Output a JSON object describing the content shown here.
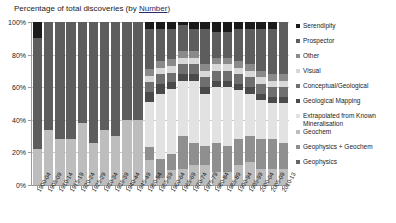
{
  "chart": {
    "title_main": "Percentage of total discoveries (by ",
    "title_underlined": "Number",
    "title_close": ")"
  },
  "axis": {
    "y_ticks": [
      "100%",
      "80%",
      "60%",
      "40%",
      "20%",
      "0%"
    ],
    "y_values": [
      100,
      80,
      60,
      40,
      20,
      0
    ]
  },
  "legend": {
    "items": [
      {
        "label": "Serendipity",
        "color": "#1a1a1a"
      },
      {
        "label": "Prospector",
        "color": "#5d5d5d"
      },
      {
        "label": "Other",
        "color": "#8a8a8a"
      },
      {
        "label": "Visual",
        "color": "#d8d8d8"
      },
      {
        "label": "Conceptual/Geological",
        "color": "#6f6f6f"
      },
      {
        "label": "Geological Mapping",
        "color": "#4a4a4a"
      },
      {
        "label": "Extrapolated from Known Mineralisation",
        "color": "#e2e2e2"
      },
      {
        "label": "Geochem",
        "color": "#bdbdbd"
      },
      {
        "label": "Geophysics + Geochem",
        "color": "#8f8f8f"
      },
      {
        "label": "Geophysics",
        "color": "#666666"
      }
    ]
  },
  "chart_data": {
    "type": "bar",
    "subtype": "100% stacked column",
    "title": "Percentage of total discoveries (by Number)",
    "xlabel": "",
    "ylabel": "",
    "ylim": [
      0,
      100
    ],
    "grid": true,
    "legend_position": "right",
    "categories": [
      "1900-04",
      "1905-09",
      "1910-14",
      "1915-19",
      "1920-24",
      "1925-29",
      "1930-34",
      "1935-39",
      "1940-44",
      "1945-49",
      "1950-54",
      "1955-59",
      "1960-64",
      "1965-69",
      "1970-74",
      "1975-79",
      "1980-84",
      "1985-89",
      "1990-94",
      "1995-99",
      "2000-04",
      "2005-09",
      "2010-13"
    ],
    "series": [
      {
        "name": "Geochem",
        "values": [
          22,
          34,
          28,
          28,
          38,
          26,
          34,
          30,
          40,
          40,
          15,
          4,
          9,
          10,
          12,
          12,
          8,
          8,
          12,
          14,
          10,
          10,
          10
        ]
      },
      {
        "name": "Geophysics + Geochem",
        "values": [
          0,
          0,
          0,
          0,
          0,
          0,
          0,
          0,
          0,
          0,
          8,
          12,
          10,
          20,
          14,
          12,
          18,
          16,
          16,
          16,
          18,
          18,
          16
        ]
      },
      {
        "name": "Extrapolated from Known Mineralisation",
        "values": [
          0,
          0,
          0,
          0,
          0,
          0,
          0,
          0,
          0,
          0,
          28,
          40,
          40,
          34,
          38,
          32,
          34,
          36,
          30,
          26,
          24,
          22,
          24
        ]
      },
      {
        "name": "Geological Mapping",
        "values": [
          0,
          0,
          0,
          0,
          0,
          0,
          0,
          0,
          0,
          0,
          6,
          6,
          4,
          4,
          4,
          4,
          4,
          4,
          4,
          4,
          4,
          4,
          4
        ]
      },
      {
        "name": "Conceptual/Geological",
        "values": [
          0,
          0,
          0,
          0,
          0,
          0,
          0,
          0,
          0,
          0,
          6,
          6,
          6,
          6,
          6,
          6,
          6,
          6,
          6,
          6,
          6,
          6,
          6
        ]
      },
      {
        "name": "Visual",
        "values": [
          0,
          0,
          0,
          0,
          0,
          0,
          0,
          0,
          0,
          0,
          4,
          4,
          4,
          4,
          4,
          4,
          4,
          4,
          4,
          4,
          4,
          4,
          4
        ]
      },
      {
        "name": "Other",
        "values": [
          0,
          0,
          0,
          0,
          0,
          0,
          0,
          0,
          0,
          0,
          4,
          4,
          4,
          4,
          4,
          4,
          4,
          4,
          4,
          4,
          4,
          4,
          4
        ]
      },
      {
        "name": "Prospector",
        "values": [
          68,
          66,
          72,
          72,
          62,
          74,
          66,
          70,
          60,
          60,
          25,
          20,
          19,
          16,
          14,
          22,
          16,
          16,
          20,
          22,
          26,
          28,
          32
        ]
      },
      {
        "name": "Serendipity",
        "values": [
          10,
          0,
          0,
          0,
          0,
          0,
          0,
          0,
          0,
          0,
          4,
          4,
          4,
          2,
          4,
          4,
          6,
          6,
          4,
          4,
          4,
          4,
          0
        ]
      }
    ],
    "stack_order_bottom_to_top": [
      "Geochem",
      "Geophysics + Geochem",
      "Extrapolated from Known Mineralisation",
      "Geological Mapping",
      "Conceptual/Geological",
      "Visual",
      "Other",
      "Prospector",
      "Serendipity"
    ]
  }
}
